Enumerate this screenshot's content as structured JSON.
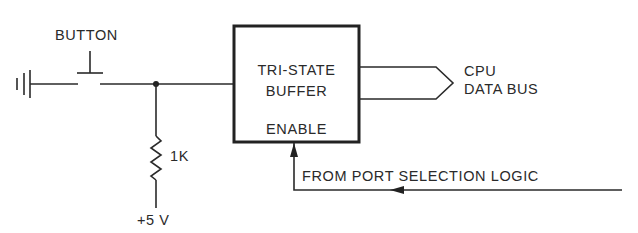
{
  "diagram": {
    "type": "circuit-schematic",
    "labels": {
      "button": "BUTTON",
      "buffer_line1": "TRI-STATE",
      "buffer_line2": "BUFFER",
      "enable": "ENABLE",
      "resistor": "1K",
      "supply": "+5 V",
      "bus_line1": "CPU",
      "bus_line2": "DATA BUS",
      "enable_source": "FROM PORT SELECTION LOGIC"
    },
    "components": [
      {
        "id": "ground",
        "kind": "ground-symbol"
      },
      {
        "id": "button",
        "kind": "push-button",
        "label": "BUTTON"
      },
      {
        "id": "junction",
        "kind": "node"
      },
      {
        "id": "resistor",
        "kind": "resistor",
        "value": "1K"
      },
      {
        "id": "supply",
        "kind": "voltage-source",
        "value": "+5 V"
      },
      {
        "id": "buffer",
        "kind": "tri-state-buffer",
        "label": "TRI-STATE BUFFER",
        "control": "ENABLE"
      },
      {
        "id": "bus",
        "kind": "bus-arrow",
        "label": "CPU DATA BUS"
      }
    ],
    "connections": [
      {
        "from": "ground",
        "to": "button"
      },
      {
        "from": "button",
        "to": "junction"
      },
      {
        "from": "junction",
        "to": "buffer"
      },
      {
        "from": "junction",
        "to": "resistor"
      },
      {
        "from": "resistor",
        "to": "supply"
      },
      {
        "from": "buffer",
        "to": "bus"
      },
      {
        "from": "enable_source",
        "to": "buffer.enable"
      }
    ],
    "colors": {
      "ink": "#2a2a2a",
      "background": "#ffffff"
    }
  }
}
